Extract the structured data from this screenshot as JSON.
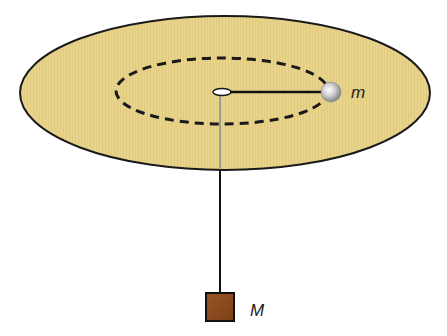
{
  "diagram": {
    "labels": {
      "orbiting_mass": "m",
      "hanging_mass": "M"
    },
    "colors": {
      "table": "#e8d38a",
      "table_outline": "#1a1a1a",
      "orbit_path": "#1a1a1a",
      "ball": "#bdbdbd",
      "box": "#8b4a1c",
      "string": "#111111"
    },
    "elements": [
      {
        "name": "table",
        "shape": "ellipse"
      },
      {
        "name": "orbit-path",
        "shape": "dashed ellipse"
      },
      {
        "name": "hole",
        "shape": "small ellipse"
      },
      {
        "name": "string-horizontal",
        "shape": "line"
      },
      {
        "name": "string-vertical",
        "shape": "line"
      },
      {
        "name": "orbiting-ball",
        "shape": "sphere",
        "label": "m"
      },
      {
        "name": "hanging-block",
        "shape": "square",
        "label": "M"
      }
    ]
  }
}
